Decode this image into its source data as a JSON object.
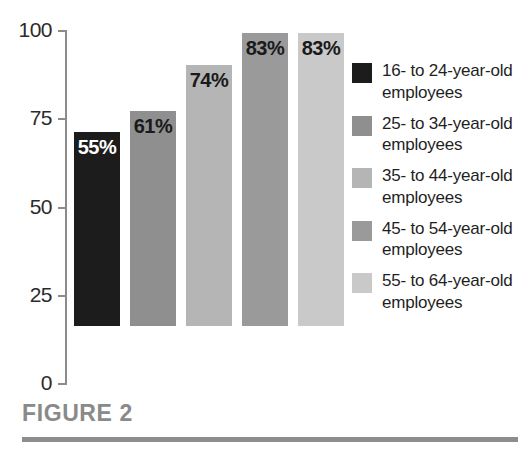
{
  "chart_data": {
    "type": "bar",
    "title": "FIGURE 2",
    "xlabel": "",
    "ylabel": "",
    "ylim": [
      0,
      100
    ],
    "yticks": [
      0,
      25,
      50,
      75,
      100
    ],
    "ytick_labels": [
      "0",
      "25",
      "50",
      "75",
      "100"
    ],
    "grid": false,
    "legend_position": "right",
    "categories": [
      "16- to 24-year-old employees",
      "25- to 34-year-old employees",
      "35- to 44-year-old employees",
      "45- to 54-year-old employees",
      "55- to 64-year-old employees"
    ],
    "values": [
      55,
      61,
      74,
      83,
      83
    ],
    "data_labels": [
      "55%",
      "61%",
      "74%",
      "83%",
      "83%"
    ],
    "colors": [
      "#1c1c1c",
      "#8f8f8f",
      "#b5b5b5",
      "#9a9a9a",
      "#c9c9c9"
    ],
    "label_colors": [
      "#ffffff",
      "#1a1a1a",
      "#1a1a1a",
      "#1a1a1a",
      "#1a1a1a"
    ]
  },
  "axis": {
    "ticks": [
      {
        "label": "100",
        "value": 100
      },
      {
        "label": "75",
        "value": 75
      },
      {
        "label": "50",
        "value": 50
      },
      {
        "label": "25",
        "value": 25
      },
      {
        "label": "0",
        "value": 0
      }
    ]
  },
  "legend": {
    "items": [
      {
        "label": "16- to 24-year-old employees",
        "color": "#1c1c1c"
      },
      {
        "label": "25- to 34-year-old employees",
        "color": "#8f8f8f"
      },
      {
        "label": "35- to 44-year-old employees",
        "color": "#b5b5b5"
      },
      {
        "label": "45- to 54-year-old employees",
        "color": "#9a9a9a"
      },
      {
        "label": "55- to 64-year-old employees",
        "color": "#c9c9c9"
      }
    ]
  },
  "caption": {
    "text": "FIGURE 2",
    "color": "#8a8a8a"
  }
}
